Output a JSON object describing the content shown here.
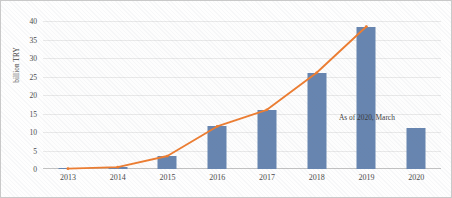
{
  "chart_data": {
    "type": "bar",
    "title": "",
    "subtitle": "",
    "xlabel": "",
    "ylabel": "billion TRY",
    "categories": [
      "2013",
      "2014",
      "2015",
      "2016",
      "2017",
      "2018",
      "2019",
      "2020"
    ],
    "values": [
      0.1,
      0.5,
      3.5,
      11.5,
      16,
      26,
      38.5,
      11
    ],
    "series": [
      {
        "name": "bars",
        "type": "bar",
        "values": [
          0.1,
          0.5,
          3.5,
          11.5,
          16,
          26,
          38.5,
          11
        ],
        "color": "#6785B0"
      },
      {
        "name": "trend-line",
        "type": "line",
        "values": [
          0.1,
          0.5,
          3.5,
          11.5,
          16,
          26,
          38.5,
          null
        ],
        "color": "#ED7D31"
      }
    ],
    "ylim": [
      0,
      40
    ],
    "yticks": [
      0,
      5,
      10,
      15,
      20,
      25,
      30,
      35,
      40
    ],
    "ytick_labels": [
      "0",
      "5",
      "10",
      "15",
      "20",
      "25",
      "30",
      "35",
      "40"
    ],
    "grid": true,
    "legend": false,
    "legend_position": "none",
    "annotations": [
      {
        "text": "As of 2020, March",
        "x": "2020",
        "y": 14
      }
    ]
  },
  "annotation_text": "As of 2020, March",
  "colors": {
    "bar": "#6785B0",
    "line": "#ED7D31",
    "gridline": "#E9E9E9",
    "axis": "#C2C2C2",
    "text": "#4A4A4A",
    "background": "#FEFEFE"
  }
}
